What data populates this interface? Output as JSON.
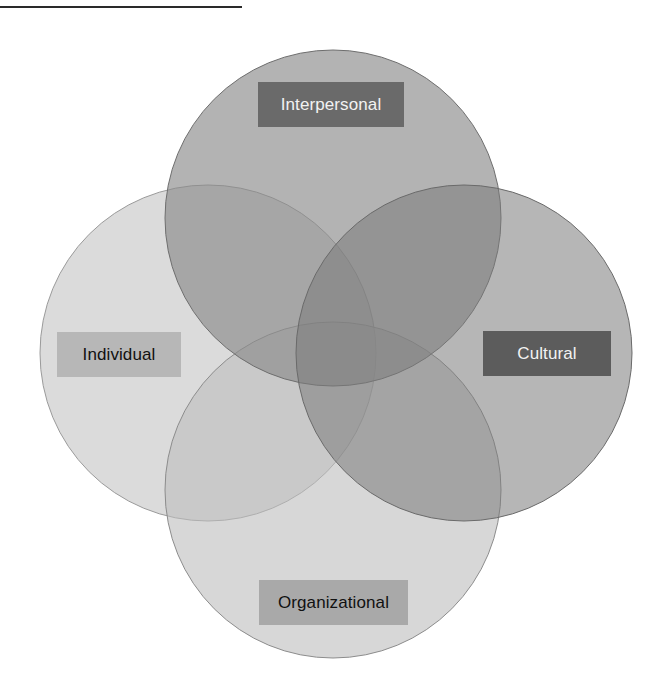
{
  "diagram": {
    "type": "venn",
    "circles": [
      {
        "id": "interpersonal",
        "label": "Interpersonal",
        "cx": 333,
        "cy": 218,
        "r": 168,
        "fill": "#8e8e8e",
        "opacity": 0.75,
        "label_box": {
          "x": 258,
          "y": 82,
          "w": 146,
          "h": 45,
          "bg": "#6a6a6a",
          "color": "#f2f2f2"
        }
      },
      {
        "id": "individual",
        "label": "Individual",
        "cx": 208,
        "cy": 353,
        "r": 168,
        "fill": "#cfcfcf",
        "opacity": 0.7,
        "label_box": {
          "x": 57,
          "y": 332,
          "w": 124,
          "h": 45,
          "bg": "#b7b7b7",
          "color": "#111111"
        }
      },
      {
        "id": "cultural",
        "label": "Cultural",
        "cx": 464,
        "cy": 353,
        "r": 168,
        "fill": "#7f7f7f",
        "opacity": 0.7,
        "label_box": {
          "x": 483,
          "y": 331,
          "w": 128,
          "h": 45,
          "bg": "#5c5c5c",
          "color": "#f2f2f2"
        }
      },
      {
        "id": "organizational",
        "label": "Organizational",
        "cx": 333,
        "cy": 490,
        "r": 168,
        "fill": "#c4c4c4",
        "opacity": 0.6,
        "label_box": {
          "x": 259,
          "y": 580,
          "w": 149,
          "h": 45,
          "bg": "#a9a9a9",
          "color": "#111111"
        }
      }
    ],
    "stroke_color": "#7a7a7a",
    "top_rule": {
      "x": 0,
      "y": 6,
      "w": 242,
      "h": 2,
      "color": "#2a2a2a"
    }
  },
  "labels": {
    "interpersonal": "Interpersonal",
    "individual": "Individual",
    "cultural": "Cultural",
    "organizational": "Organizational"
  }
}
